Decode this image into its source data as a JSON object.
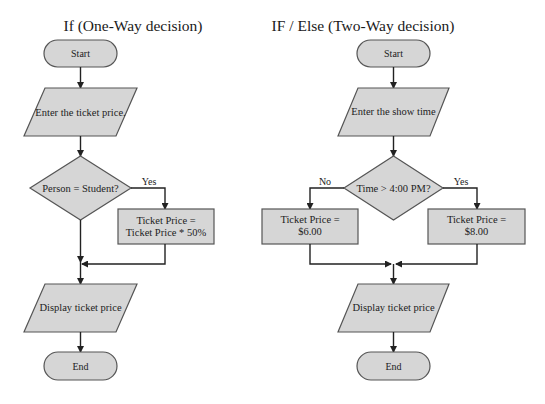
{
  "colors": {
    "shape_fill": "#d6d6d6",
    "shape_stroke": "#555555",
    "line": "#222222",
    "background": "#ffffff"
  },
  "left": {
    "title": "If (One-Way decision)",
    "start": "Start",
    "input": "Enter the ticket price.",
    "decision": "Person = Student?",
    "yes_label": "Yes",
    "process_line1": "Ticket Price =",
    "process_line2": "Ticket Price * 50%",
    "output": "Display ticket price",
    "end": "End"
  },
  "right": {
    "title": "IF / Else (Two-Way decision)",
    "start": "Start",
    "input": "Enter the show time",
    "decision": "Time > 4:00 PM?",
    "no_label": "No",
    "yes_label": "Yes",
    "no_process_line1": "Ticket Price =",
    "no_process_line2": "$6.00",
    "yes_process_line1": "Ticket Price =",
    "yes_process_line2": "$8.00",
    "output": "Display ticket price",
    "end": "End"
  }
}
